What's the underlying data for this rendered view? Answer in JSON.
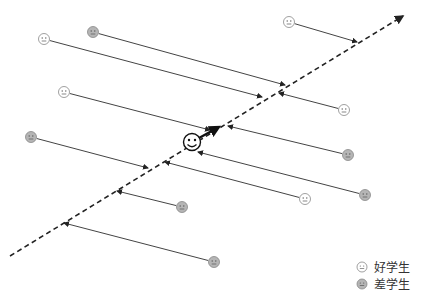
{
  "diagram": {
    "type": "projection-diagram",
    "colors": {
      "good": "#ffffff",
      "bad": "#b5b5b5",
      "line": "#444444",
      "axis": "#222222"
    },
    "students": [
      {
        "kind": "good",
        "label": "好学生"
      },
      {
        "kind": "bad",
        "label": "差学生"
      },
      {
        "kind": "good",
        "label": "好学生"
      },
      {
        "kind": "good",
        "label": "好学生"
      },
      {
        "kind": "good",
        "label": "好学生"
      },
      {
        "kind": "bad",
        "label": "差学生"
      },
      {
        "kind": "bad",
        "label": "差学生"
      },
      {
        "kind": "bad",
        "label": "差学生"
      },
      {
        "kind": "good",
        "label": "好学生"
      },
      {
        "kind": "bad",
        "label": "差学生"
      },
      {
        "kind": "bad",
        "label": "差学生"
      }
    ],
    "center": {
      "label": "smiley-center"
    }
  },
  "legend": {
    "good_label": "好学生",
    "bad_label": "差学生"
  }
}
